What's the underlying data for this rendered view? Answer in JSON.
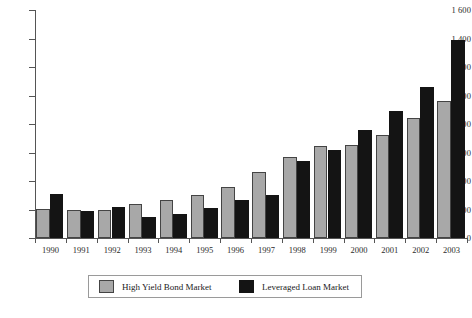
{
  "chart_data": {
    "type": "bar",
    "title": "",
    "subtitle": "",
    "xlabel": "",
    "ylabel": "",
    "categories": [
      "1990",
      "1991",
      "1992",
      "1993",
      "1994",
      "1995",
      "1996",
      "1997",
      "1998",
      "1999",
      "2000",
      "2001",
      "2002",
      "2003"
    ],
    "series": [
      {
        "name": "High Yield Bond Market",
        "color": "#a8a8a8",
        "values": [
          205,
          200,
          200,
          240,
          270,
          300,
          355,
          460,
          570,
          645,
          655,
          725,
          845,
          965
        ]
      },
      {
        "name": "Leveraged Loan Market",
        "color": "#141414",
        "values": [
          310,
          190,
          215,
          145,
          170,
          210,
          270,
          305,
          540,
          620,
          760,
          890,
          1060,
          1390
        ]
      }
    ],
    "ylim": [
      0,
      1600
    ],
    "ytick_values": [
      0,
      200,
      400,
      600,
      800,
      1000,
      1200,
      1400,
      1600
    ],
    "ytick_labels": [
      "0",
      "200",
      "400",
      "600",
      "800",
      "1 000",
      "1 200",
      "1 400",
      "1 600"
    ],
    "grid": false,
    "legend_position": "bottom",
    "legend_entries": [
      "High Yield Bond Market",
      "Leveraged Loan Market"
    ]
  }
}
